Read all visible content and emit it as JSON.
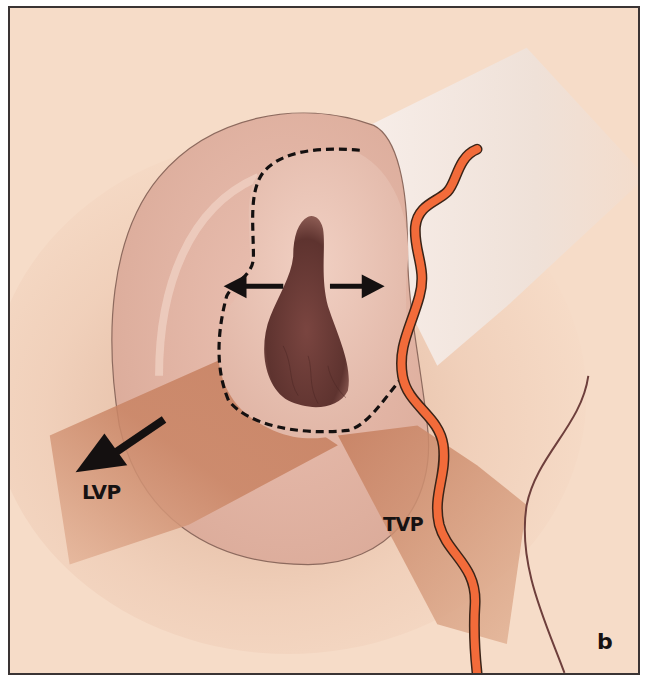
{
  "figure": {
    "panel_label": "b",
    "labels": {
      "lvp": "LVP",
      "tvp": "TVP"
    },
    "annotations": {
      "dashed_outline": "incision / resection outline around orifice",
      "double_arrows": "lateral widening arrows (left and right)",
      "lvp_arrow": "pull direction toward lower-left"
    },
    "colors": {
      "background": "#f6dcc8",
      "tissue": "#e0b09f",
      "muscle_band": "#c98866",
      "orifice": "#6b3b36",
      "vessel": "#f26b3a",
      "vessel_outline": "#3a2418",
      "white_band": "#f8f0ec",
      "frame": "#3a3434",
      "text": "#161212"
    }
  }
}
